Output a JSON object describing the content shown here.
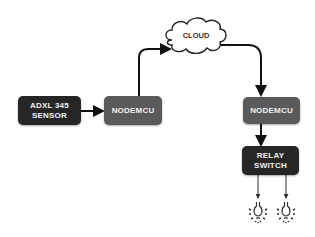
{
  "diagram": {
    "nodes": {
      "sensor": {
        "line1": "ADXL 345",
        "line2": "SENSOR"
      },
      "nodemcu_left": {
        "label": "NODEMCU"
      },
      "cloud": {
        "label": "CLOUD"
      },
      "nodemcu_right": {
        "label": "NODEMCU"
      },
      "relay": {
        "line1": "RELAY",
        "line2": "SWITCH"
      },
      "bulbs": [
        {
          "icon": "light-bulb-icon"
        },
        {
          "icon": "light-bulb-icon"
        }
      ]
    },
    "edges": [
      {
        "from": "ADXL 345 SENSOR",
        "to": "NODEMCU"
      },
      {
        "from": "NODEMCU",
        "to": "CLOUD"
      },
      {
        "from": "CLOUD",
        "to": "NODEMCU"
      },
      {
        "from": "NODEMCU",
        "to": "RELAY SWITCH"
      },
      {
        "from": "RELAY SWITCH",
        "to": "bulb 1"
      },
      {
        "from": "RELAY SWITCH",
        "to": "bulb 2"
      }
    ],
    "colors": {
      "dark_box": "#262626",
      "grey_box": "#5a5a5a",
      "line": "#111111"
    }
  }
}
